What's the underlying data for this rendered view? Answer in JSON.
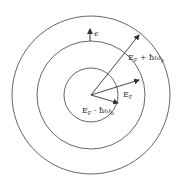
{
  "diagram": {
    "type": "concentric-energy-shells",
    "center": {
      "x": 91,
      "y": 95
    },
    "circles": [
      {
        "name": "inner",
        "r": 27
      },
      {
        "name": "middle",
        "r": 54
      },
      {
        "name": "outer",
        "r": 79
      }
    ],
    "colors": {
      "stroke": "#333333",
      "background": "#ffffff"
    },
    "labels": {
      "epsilon": "ϵ",
      "outer_main": "E",
      "outer_sub": "F",
      "outer_rest": " + ħω",
      "outer_rest_sub": "h",
      "middle_main": "E",
      "middle_sub": "F",
      "inner_main": "E",
      "inner_sub": "F",
      "inner_rest": " - ħω",
      "inner_rest_sub": "h"
    }
  }
}
